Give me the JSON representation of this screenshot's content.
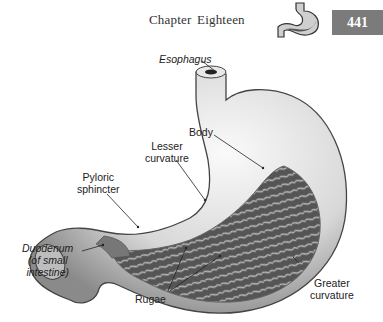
{
  "header": {
    "chapter_title": "Chapter Eighteen",
    "page_number": "441",
    "thumbnail_icon": "stomach-icon",
    "badge_color": "#7b7b7b"
  },
  "figure": {
    "labels": {
      "esophagus": "Esophagus",
      "body": "Body",
      "lesser_curvature_1": "Lesser",
      "lesser_curvature_2": "curvature",
      "pyloric_1": "Pyloric",
      "pyloric_2": "sphincter",
      "duodenum_1": "Duodenum",
      "duodenum_2": "(of small",
      "duodenum_3": "intestine)",
      "rugae": "Rugae",
      "greater_curvature_1": "Greater",
      "greater_curvature_2": "curvature"
    }
  }
}
